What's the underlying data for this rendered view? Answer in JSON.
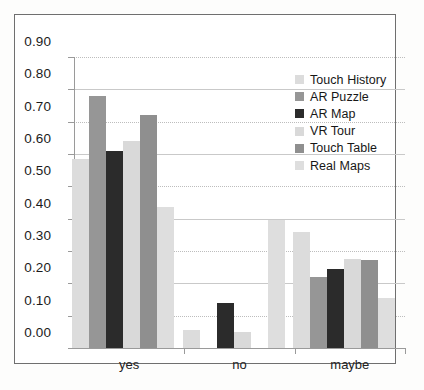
{
  "chart_data": {
    "type": "bar",
    "title": "",
    "subtitle": "",
    "xlabel": "",
    "ylabel": "",
    "categories": [
      "yes",
      "no",
      "maybe"
    ],
    "ylim": [
      0.0,
      0.9
    ],
    "ytick_labels": [
      "0.90",
      "0.80",
      "0.70",
      "0.60",
      "0.50",
      "0.40",
      "0.30",
      "0.20",
      "0.10",
      "0.00"
    ],
    "ytick_values": [
      0.9,
      0.8,
      0.7,
      0.6,
      0.5,
      0.4,
      0.3,
      0.2,
      0.1,
      0.0
    ],
    "ytick_step": 0.1,
    "grid": true,
    "grid_axis": "y",
    "legend_position": "upper-right-inside",
    "series": [
      {
        "name": "Touch History",
        "color": "#dcdcdc",
        "values": [
          0.585,
          0.055,
          0.36
        ]
      },
      {
        "name": "AR Puzzle",
        "color": "#969696",
        "values": [
          0.78,
          0.0,
          0.22
        ]
      },
      {
        "name": "AR Map",
        "color": "#2b2b2b",
        "values": [
          0.61,
          0.14,
          0.245
        ]
      },
      {
        "name": "VR Tour",
        "color": "#d9d9d9",
        "values": [
          0.64,
          0.048,
          0.275
        ]
      },
      {
        "name": "Touch Table",
        "color": "#8f8f8f",
        "values": [
          0.72,
          0.0,
          0.273
        ]
      },
      {
        "name": "Real Maps",
        "color": "#dedede",
        "values": [
          0.435,
          0.395,
          0.155
        ]
      }
    ]
  },
  "legend": {
    "items": [
      {
        "label": "Touch History",
        "color": "#dcdcdc"
      },
      {
        "label": "AR Puzzle",
        "color": "#969696"
      },
      {
        "label": "AR Map",
        "color": "#2b2b2b"
      },
      {
        "label": "VR Tour",
        "color": "#d9d9d9"
      },
      {
        "label": "Touch Table",
        "color": "#8f8f8f"
      },
      {
        "label": "Real Maps",
        "color": "#dedede"
      }
    ]
  },
  "axis": {
    "y_labels": [
      "0.90",
      "0.80",
      "0.70",
      "0.60",
      "0.50",
      "0.40",
      "0.30",
      "0.20",
      "0.10",
      "0.00"
    ],
    "x_labels": [
      "yes",
      "no",
      "maybe"
    ]
  },
  "style": {
    "grid_color": "#c9c9c9",
    "axis_color": "#9a9a9a",
    "frame_color": "#6f6f6f",
    "background": "#ffffff",
    "text_color": "#1a1a1a"
  }
}
